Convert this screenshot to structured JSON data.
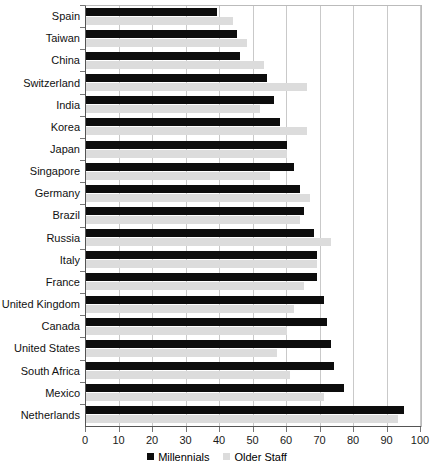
{
  "chart_data": {
    "type": "bar",
    "orientation": "horizontal",
    "title": "",
    "xlabel": "",
    "ylabel": "",
    "xlim": [
      0,
      100
    ],
    "grid": true,
    "legend_position": "bottom",
    "xticks": [
      0,
      10,
      20,
      30,
      40,
      50,
      60,
      70,
      80,
      90,
      100
    ],
    "categories": [
      "Spain",
      "Taiwan",
      "China",
      "Switzerland",
      "India",
      "Korea",
      "Japan",
      "Singapore",
      "Germany",
      "Brazil",
      "Russia",
      "Italy",
      "France",
      "United Kingdom",
      "Canada",
      "United States",
      "South Africa",
      "Mexico",
      "Netherlands"
    ],
    "series": [
      {
        "name": "Millennials",
        "color": "#0d0d0d",
        "values": [
          39,
          45,
          46,
          54,
          56,
          58,
          60,
          62,
          64,
          65,
          68,
          69,
          69,
          71,
          72,
          73,
          74,
          77,
          95
        ]
      },
      {
        "name": "Older Staff",
        "color": "#dcdcdc",
        "values": [
          44,
          48,
          53,
          66,
          52,
          66,
          60,
          55,
          67,
          64,
          73,
          69,
          65,
          62,
          60,
          57,
          61,
          71,
          93
        ]
      }
    ]
  },
  "legend": {
    "items": [
      {
        "label": "Millennials",
        "swatch": "legend-swatch-millennials"
      },
      {
        "label": "Older Staff",
        "swatch": "legend-swatch-older-staff"
      }
    ]
  },
  "axis": {
    "tick_labels": [
      "0",
      "10",
      "20",
      "30",
      "40",
      "50",
      "60",
      "70",
      "80",
      "90",
      "100"
    ]
  }
}
